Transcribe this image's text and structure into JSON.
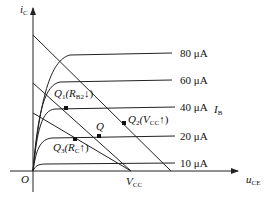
{
  "diagram": {
    "y_axis_label": "i",
    "y_axis_sub": "C",
    "x_axis_label": "u",
    "x_axis_sub": "CE",
    "origin_label": "O",
    "vcc_label": "V",
    "vcc_sub": "CC",
    "param_label": "I",
    "param_sub": "B",
    "curves": [
      {
        "label": "80 μA",
        "y": 53
      },
      {
        "label": "60 μA",
        "y": 80
      },
      {
        "label": "40 μA",
        "y": 107
      },
      {
        "label": "20 μA",
        "y": 136
      },
      {
        "label": "10 μA",
        "y": 163
      }
    ],
    "points": {
      "q": "Q",
      "q1": "Q",
      "q1_sub": "1",
      "q1_paren": "(R",
      "q1_paren_sub": "B2",
      "q1_arrow": "↓)",
      "q2": "Q",
      "q2_sub": "2",
      "q2_paren": "(V",
      "q2_paren_sub": "CC",
      "q2_arrow": "↑)",
      "q3": "Q",
      "q3_sub": "3",
      "q3_paren": "(R",
      "q3_paren_sub": "C",
      "q3_arrow": "↑)"
    },
    "colors": {
      "line": "#222222"
    }
  }
}
